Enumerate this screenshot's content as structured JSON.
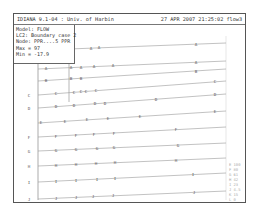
{
  "window": {
    "title_left": "IDIANA 9.1-04 : Univ. of Harbin",
    "title_right": "27 APR 2007 21:25:02 flow3"
  },
  "info": {
    "lines": [
      "Model: FLOW",
      "LC2: Boundary case 2",
      "Node: PPR....5 PPR",
      "Max = 97",
      "Min = -17.9"
    ]
  },
  "plot": {
    "axis_color": "#888888",
    "line_color": "#999999",
    "label_color": "#555555",
    "lines": [
      {
        "id": "top",
        "label": "A",
        "y_left": 48,
        "y_right": 42,
        "x_start": 68,
        "labels_x": [
          90,
          98,
          195
        ]
      },
      {
        "id": "A",
        "label": "A",
        "y_left": 68,
        "y_right": 60,
        "x_start": 24,
        "labels_x": [
          45,
          70,
          80,
          93,
          112,
          195
        ]
      },
      {
        "id": "B",
        "label": "B",
        "y_left": 80,
        "y_right": 68,
        "x_start": 24,
        "labels_x": [
          45,
          70,
          80,
          195
        ]
      },
      {
        "id": "C",
        "label": "C",
        "y_left": 94,
        "y_right": 80,
        "x_start": 24,
        "labels_x": [
          28,
          55,
          73,
          80,
          85,
          95,
          214
        ]
      },
      {
        "id": "D",
        "label": "D",
        "y_left": 107,
        "y_right": 93,
        "x_start": 24,
        "labels_x": [
          28,
          55,
          73,
          94,
          104,
          155,
          214
        ]
      },
      {
        "id": "E",
        "label": "E",
        "y_left": 122,
        "y_right": 110,
        "x_start": 24,
        "labels_x": [
          40,
          64,
          86,
          107,
          139,
          214
        ]
      },
      {
        "id": "F",
        "label": "F",
        "y_left": 136,
        "y_right": 126,
        "x_start": 24,
        "labels_x": [
          28,
          55,
          75,
          93,
          113,
          175
        ]
      },
      {
        "id": "G",
        "label": "G",
        "y_left": 150,
        "y_right": 142,
        "x_start": 24,
        "labels_x": [
          28,
          55,
          75,
          96,
          113,
          177
        ]
      },
      {
        "id": "H",
        "label": "H",
        "y_left": 165,
        "y_right": 157,
        "x_start": 24,
        "labels_x": [
          28,
          55,
          75,
          95,
          114,
          175
        ]
      },
      {
        "id": "I",
        "label": "I",
        "y_left": 181,
        "y_right": 172,
        "x_start": 24,
        "labels_x": [
          28,
          55,
          75,
          96,
          114,
          192
        ]
      },
      {
        "id": "J",
        "label": "J",
        "y_left": 198,
        "y_right": 190,
        "x_start": 24,
        "labels_x": [
          28,
          55,
          75,
          92,
          112,
          193
        ]
      }
    ]
  },
  "legend": {
    "entries": [
      "E 100",
      "F 80",
      "G 61",
      "H 42",
      "I 23",
      "J 4.5",
      "K 15",
      "L 0"
    ]
  }
}
